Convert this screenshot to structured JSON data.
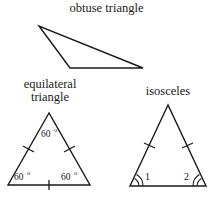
{
  "figure": {
    "type": "geometry-diagram",
    "background_color": "#ffffff",
    "line_color": "#1a1a1a"
  },
  "labels": {
    "obtuse": "obtuse triangle",
    "equilateral": "equilateral\ntriangle",
    "isosceles": "isosceles"
  },
  "equilateral_angles": {
    "apex": "60",
    "apex_degree_symbol": "o",
    "left": "60",
    "left_degree_symbol": "o",
    "right": "60",
    "right_degree_symbol": "o"
  },
  "isosceles_angles": {
    "left": "1",
    "right": "2"
  },
  "shapes": {
    "obtuse_triangle": {
      "name": "obtuse-triangle",
      "vertices": [
        [
          39,
          26
        ],
        [
          70,
          68
        ],
        [
          143,
          68
        ]
      ]
    },
    "equilateral_triangle": {
      "name": "equilateral-triangle",
      "vertices": [
        [
          49,
          113
        ],
        [
          8,
          185
        ],
        [
          90,
          185
        ]
      ],
      "congruence_ticks": 1
    },
    "isosceles_triangle": {
      "name": "isosceles-triangle",
      "vertices": [
        [
          168,
          105
        ],
        [
          130,
          186
        ],
        [
          206,
          186
        ]
      ],
      "congruence_ticks": 1,
      "base_angle_arcs": 2
    }
  }
}
